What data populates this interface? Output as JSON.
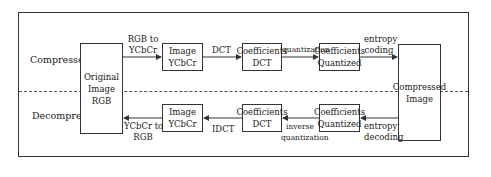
{
  "sections": {
    "compressor": "Compressor",
    "decompressor": "Decompressor"
  },
  "boxes": {
    "original": [
      "Original",
      "Image",
      "RGB"
    ],
    "ycbcr_top": [
      "Image",
      "YCbCr"
    ],
    "dct_top": [
      "Coefficients",
      "DCT"
    ],
    "quant_top": [
      "Coefficients",
      "Quantized"
    ],
    "compressed": [
      "Compressed",
      "Image"
    ],
    "ycbcr_bottom": [
      "Image",
      "YCbCr"
    ],
    "dct_bottom": [
      "Coefficients",
      "DCT"
    ],
    "quant_bottom": [
      "Coefficients",
      "Quantized"
    ]
  },
  "edges": {
    "rgb_to_ycbcr": [
      "RGB to",
      "YCbCr"
    ],
    "dct": "DCT",
    "quantization": "quantization",
    "entropy_coding": [
      "entropy",
      "coding"
    ],
    "entropy_decoding": [
      "entropy",
      "decoding"
    ],
    "inverse_quantization": [
      "inverse",
      "quantization"
    ],
    "idct": "IDCT",
    "ycbcr_to_rgb": [
      "YCbCr to",
      "RGB"
    ]
  }
}
